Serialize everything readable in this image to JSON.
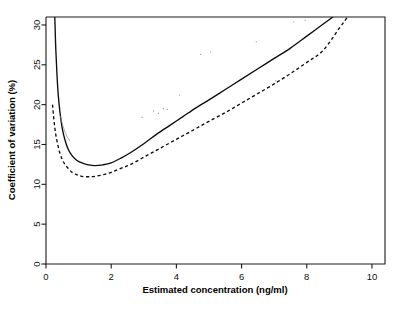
{
  "figure": {
    "background_color": "#ffffff",
    "ink_color": "#0d0d0d"
  },
  "chart_data": {
    "type": "line",
    "title": "",
    "xlabel": "Estimated concentration (ng/ml)",
    "ylabel": "Coefficient of variation (%)",
    "xlim": [
      0,
      10.4
    ],
    "ylim": [
      0,
      31
    ],
    "xticks": [
      0,
      2,
      4,
      6,
      8,
      10
    ],
    "xticklabels": [
      "0",
      "2",
      "4",
      "6",
      "8",
      "10"
    ],
    "yticks": [
      0,
      5,
      10,
      15,
      20,
      25,
      30
    ],
    "yticklabels": [
      "0",
      "5",
      "10",
      "15",
      "20",
      "25",
      "30"
    ],
    "grid": false,
    "legend": "none",
    "series": [
      {
        "name": "solid-curve",
        "style": "solid",
        "x": [
          0.27,
          0.3,
          0.34,
          0.38,
          0.43,
          0.5,
          0.58,
          0.68,
          0.8,
          0.95,
          1.1,
          1.3,
          1.5,
          1.75,
          2.0,
          2.3,
          2.6,
          3.0,
          3.4,
          3.8,
          4.2,
          4.6,
          5.0,
          5.5,
          6.0,
          6.5,
          7.0,
          7.5,
          8.0,
          8.4,
          8.8
        ],
        "y": [
          31.0,
          27.0,
          23.5,
          21.0,
          19.0,
          17.0,
          15.6,
          14.4,
          13.6,
          13.0,
          12.7,
          12.45,
          12.35,
          12.45,
          12.7,
          13.3,
          14.0,
          15.1,
          16.3,
          17.4,
          18.5,
          19.6,
          20.6,
          21.9,
          23.2,
          24.5,
          25.8,
          27.1,
          28.6,
          29.8,
          31.0
        ]
      },
      {
        "name": "dashed-curve",
        "style": "dashed",
        "x": [
          0.2,
          0.23,
          0.27,
          0.31,
          0.36,
          0.42,
          0.5,
          0.58,
          0.68,
          0.8,
          0.95,
          1.1,
          1.3,
          1.5,
          1.75,
          2.0,
          2.3,
          2.6,
          3.0,
          3.4,
          3.8,
          4.2,
          4.6,
          5.0,
          5.5,
          6.0,
          6.5,
          7.0,
          7.5,
          8.0,
          8.5,
          9.0,
          9.25
        ],
        "y": [
          20.0,
          18.6,
          17.1,
          16.0,
          15.0,
          14.0,
          13.1,
          12.5,
          12.0,
          11.5,
          11.2,
          11.0,
          10.95,
          11.0,
          11.2,
          11.5,
          12.0,
          12.5,
          13.4,
          14.3,
          15.2,
          16.1,
          17.0,
          17.9,
          19.0,
          20.2,
          21.4,
          22.6,
          23.9,
          25.3,
          26.8,
          29.6,
          31.0
        ]
      },
      {
        "name": "faint-branch",
        "style": "solid-faint",
        "x": [
          0.44,
          0.5,
          0.58,
          0.66,
          0.74
        ],
        "y": [
          18.6,
          17.6,
          16.6,
          15.9,
          15.4
        ]
      }
    ],
    "speckles": [
      {
        "x": 3.3,
        "y": 19.2
      },
      {
        "x": 3.45,
        "y": 18.9
      },
      {
        "x": 3.6,
        "y": 19.5
      },
      {
        "x": 3.72,
        "y": 19.4
      },
      {
        "x": 4.1,
        "y": 21.2
      },
      {
        "x": 4.75,
        "y": 26.3
      },
      {
        "x": 5.05,
        "y": 26.6
      },
      {
        "x": 6.45,
        "y": 27.9
      },
      {
        "x": 7.05,
        "y": 23.0
      },
      {
        "x": 2.95,
        "y": 18.4
      },
      {
        "x": 7.6,
        "y": 30.4
      },
      {
        "x": 7.95,
        "y": 30.6
      }
    ]
  }
}
